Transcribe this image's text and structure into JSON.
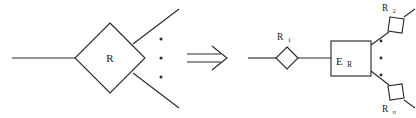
{
  "figure": {
    "background_color": "#ffffff",
    "stroke_color": "#2b2b2b",
    "text_color": "#1a1a1a",
    "width": 416,
    "height": 118
  },
  "left_side": {
    "name": "n-ary relationship",
    "diamond": {
      "label": "R",
      "center_x": 110,
      "center_y": 58,
      "half_width": 35,
      "half_height": 35
    },
    "edges": [
      {
        "name": "left-edge",
        "x1": 12,
        "y1": 58,
        "x2": 75,
        "y2": 58
      },
      {
        "name": "upper-right-edge",
        "x1": 133,
        "y1": 44,
        "x2": 179,
        "y2": 9
      },
      {
        "name": "lower-right-edge",
        "x1": 133,
        "y1": 73,
        "x2": 179,
        "y2": 108
      }
    ],
    "ellipsis": {
      "name": "vertical-ellipsis",
      "glyph": "⋮",
      "x": 161,
      "dot_ys": [
        39,
        58,
        77
      ]
    }
  },
  "arrow": {
    "name": "implication-arrow",
    "glyph": "⟹",
    "x": 187,
    "y": 58,
    "width": 40
  },
  "right_side": {
    "name": "decomposed relationship",
    "entity_box": {
      "label_main": "E",
      "label_sub": "R",
      "x": 331,
      "y": 41,
      "width": 40,
      "height": 35
    },
    "diamonds": [
      {
        "name": "relationship-r1",
        "label_main": "R",
        "label_sub": "1",
        "center_x": 287,
        "center_y": 58,
        "half_width": 11,
        "half_height": 11,
        "rotation": 0,
        "label_x": 289,
        "label_y": 38
      },
      {
        "name": "relationship-r2",
        "label_main": "R",
        "label_sub": "2",
        "center_x": 396,
        "center_y": 25,
        "half_width": 10,
        "half_height": 10,
        "rotation": -37,
        "label_x": 396,
        "label_y": 9
      },
      {
        "name": "relationship-rn",
        "label_main": "R",
        "label_sub": "n",
        "center_x": 396,
        "center_y": 92,
        "half_width": 10,
        "half_height": 10,
        "rotation": 37,
        "label_x": 397,
        "label_y": 110
      }
    ],
    "edges": [
      {
        "name": "left-stub-edge",
        "x1": 248,
        "y1": 58,
        "x2": 276,
        "y2": 58
      },
      {
        "name": "r1-to-box-edge",
        "x1": 298,
        "y1": 58,
        "x2": 331,
        "y2": 58
      },
      {
        "name": "box-to-r2-edge",
        "x1": 371,
        "y1": 45,
        "x2": 388,
        "y2": 33
      },
      {
        "name": "r2-outer-edge",
        "x1": 404,
        "y1": 17,
        "x2": 414,
        "y2": 10
      },
      {
        "name": "box-to-rn-edge",
        "x1": 371,
        "y1": 71,
        "x2": 388,
        "y2": 84
      },
      {
        "name": "rn-outer-edge",
        "x1": 404,
        "y1": 100,
        "x2": 414,
        "y2": 107
      }
    ],
    "ellipsis": {
      "name": "vertical-ellipsis",
      "glyph": "⋮",
      "x": 381,
      "dot_ys": [
        41,
        58,
        75
      ]
    }
  }
}
